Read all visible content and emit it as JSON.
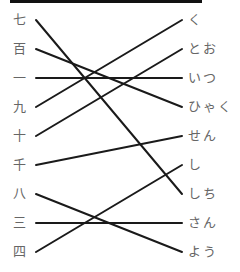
{
  "left_items": [
    {
      "label": "七",
      "y": 20
    },
    {
      "label": "百",
      "y": 49
    },
    {
      "label": "一",
      "y": 78
    },
    {
      "label": "九",
      "y": 107
    },
    {
      "label": "十",
      "y": 136
    },
    {
      "label": "千",
      "y": 165
    },
    {
      "label": "八",
      "y": 194
    },
    {
      "label": "三",
      "y": 223
    },
    {
      "label": "四",
      "y": 252
    }
  ],
  "right_items": [
    {
      "label": "く",
      "y": 20
    },
    {
      "label": "とお",
      "y": 49
    },
    {
      "label": "いつ",
      "y": 78
    },
    {
      "label": "ひゃく",
      "y": 107
    },
    {
      "label": "せん",
      "y": 136
    },
    {
      "label": "し",
      "y": 165
    },
    {
      "label": "しち",
      "y": 194
    },
    {
      "label": "さん",
      "y": 223
    },
    {
      "label": "よう",
      "y": 252
    }
  ],
  "connections": [
    {
      "from": 0,
      "to": 6
    },
    {
      "from": 1,
      "to": 3
    },
    {
      "from": 2,
      "to": 2
    },
    {
      "from": 3,
      "to": 0
    },
    {
      "from": 4,
      "to": 1
    },
    {
      "from": 5,
      "to": 4
    },
    {
      "from": 6,
      "to": 8
    },
    {
      "from": 7,
      "to": 7
    },
    {
      "from": 8,
      "to": 5
    }
  ]
}
